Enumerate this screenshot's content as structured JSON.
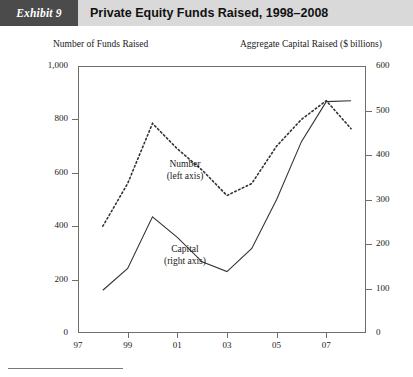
{
  "header": {
    "exhibit_tag": "Exhibit 9",
    "title": "Private Equity Funds Raised, 1998–2008"
  },
  "axis_titles": {
    "left": "Number of Funds Raised",
    "right": "Aggregate Capital Raised ($ billions)"
  },
  "annotations": {
    "number_line1": "Number",
    "number_line2": "(left axis)",
    "capital_line1": "Capital",
    "capital_line2": "(right axis)"
  },
  "colors": {
    "banner_background": "#d9d9d9",
    "tag_background": "#4b4b4b",
    "tag_text": "#ffffff",
    "line": "#333333",
    "axis": "#6e6e6e"
  },
  "chart_data": {
    "type": "line",
    "title": "Private Equity Funds Raised, 1998–2008",
    "xlabel": "",
    "ylabel": "Number of Funds Raised",
    "y2label": "Aggregate Capital Raised ($ billions)",
    "x": [
      1998,
      1999,
      2000,
      2001,
      2002,
      2003,
      2004,
      2005,
      2006,
      2007,
      2008
    ],
    "xtick_labels": [
      "97",
      "99",
      "01",
      "03",
      "05",
      "07"
    ],
    "xtick_values": [
      1997,
      1999,
      2001,
      2003,
      2005,
      2007
    ],
    "xlim": [
      1997,
      2008.6
    ],
    "ylim": [
      0,
      1000
    ],
    "y2lim": [
      0,
      600
    ],
    "ytick_labels": [
      "0",
      "200",
      "400",
      "600",
      "800",
      "1,000"
    ],
    "ytick_values": [
      0,
      200,
      400,
      600,
      800,
      1000
    ],
    "y2tick_labels": [
      "0",
      "100",
      "200",
      "300",
      "400",
      "500",
      "600"
    ],
    "y2tick_values": [
      0,
      100,
      200,
      300,
      400,
      500,
      600
    ],
    "grid": false,
    "legend": "inline-annotations",
    "series": [
      {
        "name": "Number",
        "axis": "left",
        "style": "dotted",
        "values": [
          400,
          560,
          785,
          690,
          610,
          515,
          560,
          700,
          800,
          870,
          765
        ]
      },
      {
        "name": "Capital",
        "axis": "right",
        "style": "solid",
        "values": [
          96,
          145,
          261,
          215,
          160,
          138,
          190,
          300,
          430,
          520,
          522
        ]
      }
    ]
  }
}
